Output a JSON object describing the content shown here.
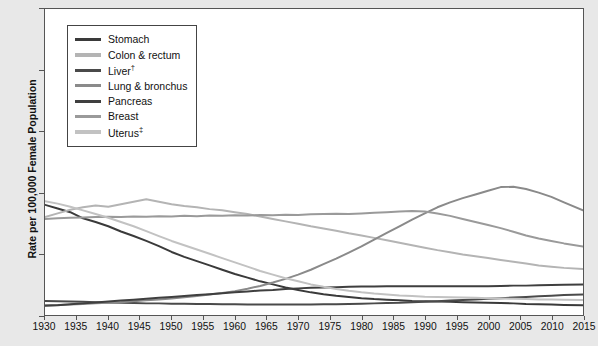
{
  "axes": {
    "ylabel": "Rate per 100,000 Female Population",
    "yticks": [
      "0",
      "20",
      "40",
      "60",
      "80",
      "100"
    ],
    "xticks": [
      "1930",
      "1935",
      "1940",
      "1945",
      "1950",
      "1955",
      "1960",
      "1965",
      "1970",
      "1975",
      "1980",
      "1985",
      "1990",
      "1995",
      "2000",
      "2005",
      "2010",
      "2015"
    ]
  },
  "legend": {
    "items": [
      {
        "label": "Stomach",
        "dagger": "",
        "color": "#3a3a3a"
      },
      {
        "label": "Colon & rectum",
        "dagger": "",
        "color": "#b4b4b4"
      },
      {
        "label": "Liver",
        "dagger": "†",
        "color": "#4a4a4a"
      },
      {
        "label": "Lung & bronchus",
        "dagger": "",
        "color": "#8a8a8a"
      },
      {
        "label": "Pancreas",
        "dagger": "",
        "color": "#3f3f3f"
      },
      {
        "label": "Breast",
        "dagger": "",
        "color": "#9a9a9a"
      },
      {
        "label": "Uterus",
        "dagger": "‡",
        "color": "#c2c2c2"
      }
    ]
  },
  "chart_data": {
    "type": "line",
    "title": "",
    "xlabel": "",
    "ylabel": "Rate per 100,000 Female Population",
    "xlim": [
      1930,
      2015
    ],
    "ylim": [
      0,
      100
    ],
    "grid": false,
    "legend_position": "top-left",
    "x": [
      1930,
      1932,
      1934,
      1936,
      1938,
      1940,
      1942,
      1944,
      1946,
      1948,
      1950,
      1952,
      1954,
      1956,
      1958,
      1960,
      1962,
      1964,
      1966,
      1968,
      1970,
      1972,
      1974,
      1976,
      1978,
      1980,
      1982,
      1984,
      1986,
      1988,
      1990,
      1992,
      1994,
      1996,
      1998,
      2000,
      2002,
      2004,
      2006,
      2008,
      2010,
      2012,
      2015
    ],
    "series": [
      {
        "name": "Stomach",
        "color": "#3a3a3a",
        "values": [
          36.0,
          34.8,
          33.6,
          31.6,
          30.4,
          29.0,
          27.3,
          25.8,
          24.2,
          22.5,
          20.6,
          19.0,
          17.6,
          16.2,
          14.8,
          13.4,
          12.2,
          11.0,
          10.0,
          9.0,
          8.2,
          7.4,
          6.8,
          6.3,
          5.9,
          5.5,
          5.2,
          5.0,
          4.8,
          4.6,
          4.5,
          4.4,
          4.3,
          4.2,
          4.1,
          4.0,
          3.9,
          3.8,
          3.6,
          3.5,
          3.4,
          3.3,
          3.2
        ]
      },
      {
        "name": "Colon & rectum",
        "color": "#b4b4b4",
        "values": [
          32.0,
          33.2,
          34.4,
          35.2,
          35.8,
          35.4,
          36.2,
          37.0,
          37.8,
          37.0,
          36.2,
          35.6,
          35.2,
          34.6,
          34.2,
          33.6,
          33.0,
          32.2,
          31.4,
          30.6,
          29.8,
          29.0,
          28.3,
          27.5,
          26.7,
          26.0,
          25.2,
          24.4,
          23.6,
          22.8,
          22.0,
          21.2,
          20.5,
          19.8,
          19.2,
          18.6,
          18.0,
          17.4,
          16.8,
          16.2,
          15.8,
          15.4,
          15.0
        ]
      },
      {
        "name": "Liver",
        "color": "#4a4a4a",
        "values": [
          4.6,
          4.5,
          4.4,
          4.3,
          4.2,
          4.1,
          4.0,
          3.9,
          3.8,
          3.8,
          3.7,
          3.7,
          3.6,
          3.6,
          3.5,
          3.5,
          3.4,
          3.4,
          3.4,
          3.4,
          3.4,
          3.4,
          3.5,
          3.5,
          3.6,
          3.7,
          3.8,
          3.9,
          4.0,
          4.2,
          4.3,
          4.5,
          4.7,
          4.9,
          5.1,
          5.3,
          5.5,
          5.7,
          5.9,
          6.1,
          6.3,
          6.5,
          6.7
        ]
      },
      {
        "name": "Lung & bronchus",
        "color": "#8a8a8a",
        "values": [
          3.2,
          3.3,
          3.4,
          3.6,
          3.8,
          4.0,
          4.2,
          4.5,
          4.8,
          5.1,
          5.4,
          5.8,
          6.2,
          6.7,
          7.2,
          7.8,
          8.6,
          9.5,
          10.6,
          11.8,
          13.2,
          14.8,
          16.6,
          18.4,
          20.4,
          22.4,
          24.6,
          26.8,
          29.0,
          31.2,
          33.2,
          35.2,
          36.8,
          38.2,
          39.4,
          40.6,
          41.8,
          41.9,
          41.2,
          40.0,
          38.6,
          36.8,
          34.2
        ]
      },
      {
        "name": "Pancreas",
        "color": "#3f3f3f",
        "values": [
          3.0,
          3.2,
          3.5,
          3.8,
          4.1,
          4.4,
          4.7,
          5.0,
          5.3,
          5.6,
          5.9,
          6.2,
          6.5,
          6.8,
          7.1,
          7.4,
          7.7,
          8.0,
          8.2,
          8.5,
          8.7,
          8.9,
          9.0,
          9.1,
          9.2,
          9.3,
          9.3,
          9.4,
          9.4,
          9.4,
          9.4,
          9.4,
          9.4,
          9.4,
          9.4,
          9.4,
          9.5,
          9.6,
          9.6,
          9.7,
          9.8,
          9.9,
          10.0
        ]
      },
      {
        "name": "Breast",
        "color": "#9a9a9a",
        "values": [
          31.4,
          31.6,
          31.8,
          31.9,
          32.0,
          32.1,
          32.0,
          32.2,
          32.1,
          32.3,
          32.2,
          32.4,
          32.3,
          32.5,
          32.4,
          32.6,
          32.5,
          32.7,
          32.6,
          32.8,
          32.7,
          32.9,
          33.0,
          33.1,
          33.0,
          33.2,
          33.4,
          33.6,
          33.8,
          34.0,
          33.8,
          33.2,
          32.4,
          31.4,
          30.4,
          29.4,
          28.4,
          27.2,
          26.0,
          25.0,
          24.2,
          23.4,
          22.4
        ]
      },
      {
        "name": "Uterus",
        "color": "#c2c2c2",
        "values": [
          37.2,
          36.4,
          35.4,
          34.2,
          33.0,
          31.8,
          30.4,
          29.0,
          27.4,
          25.8,
          24.2,
          22.8,
          21.4,
          20.0,
          18.6,
          17.2,
          15.8,
          14.4,
          13.2,
          12.0,
          11.0,
          10.0,
          9.2,
          8.5,
          7.9,
          7.4,
          7.0,
          6.7,
          6.4,
          6.2,
          6.0,
          5.9,
          5.8,
          5.7,
          5.6,
          5.5,
          5.4,
          5.3,
          5.2,
          5.1,
          5.1,
          5.0,
          4.9
        ]
      }
    ]
  }
}
